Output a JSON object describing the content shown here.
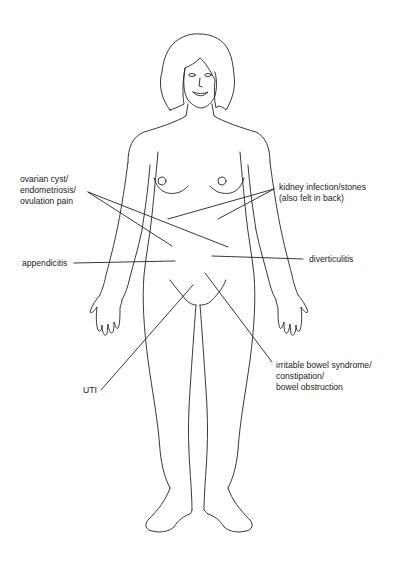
{
  "diagram": {
    "type": "anatomical body outline with pain location callouts",
    "line_color": "#222222",
    "background": "#ffffff",
    "labels": [
      {
        "id": "ovarian",
        "text": "ovarian cyst/\nendometriosis/\novulation pain",
        "side": "left"
      },
      {
        "id": "kidney",
        "text": "kidney infection/stones\n(also felt in back)",
        "side": "right"
      },
      {
        "id": "appendicitis",
        "text": "appendicitis",
        "side": "left"
      },
      {
        "id": "diverticulitis",
        "text": "diverticulitis",
        "side": "right"
      },
      {
        "id": "uti",
        "text": "UTI",
        "side": "left"
      },
      {
        "id": "ibs",
        "text": "irritable bowel syndrome/\nconstipation/\nbowel obstruction",
        "side": "right"
      }
    ]
  }
}
